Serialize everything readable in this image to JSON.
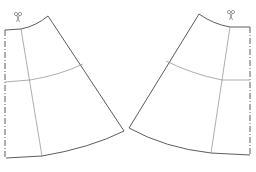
{
  "diagram": {
    "type": "sewing-pattern",
    "stroke_color": "#4a4a4a",
    "light_stroke_color": "#8a8a8a",
    "background": "#ffffff",
    "panels": [
      {
        "id": "left-panel",
        "orientation": "left",
        "fold_line": "dash-dot",
        "has_cut_mark": true,
        "cut_mark_icon": "scissors-icon",
        "guide_lines": [
          "hip-line",
          "grain-line"
        ]
      },
      {
        "id": "right-panel",
        "orientation": "right",
        "fold_line": "dash-dot",
        "has_cut_mark": true,
        "cut_mark_icon": "scissors-icon",
        "guide_lines": [
          "hip-line",
          "grain-line"
        ]
      }
    ]
  }
}
